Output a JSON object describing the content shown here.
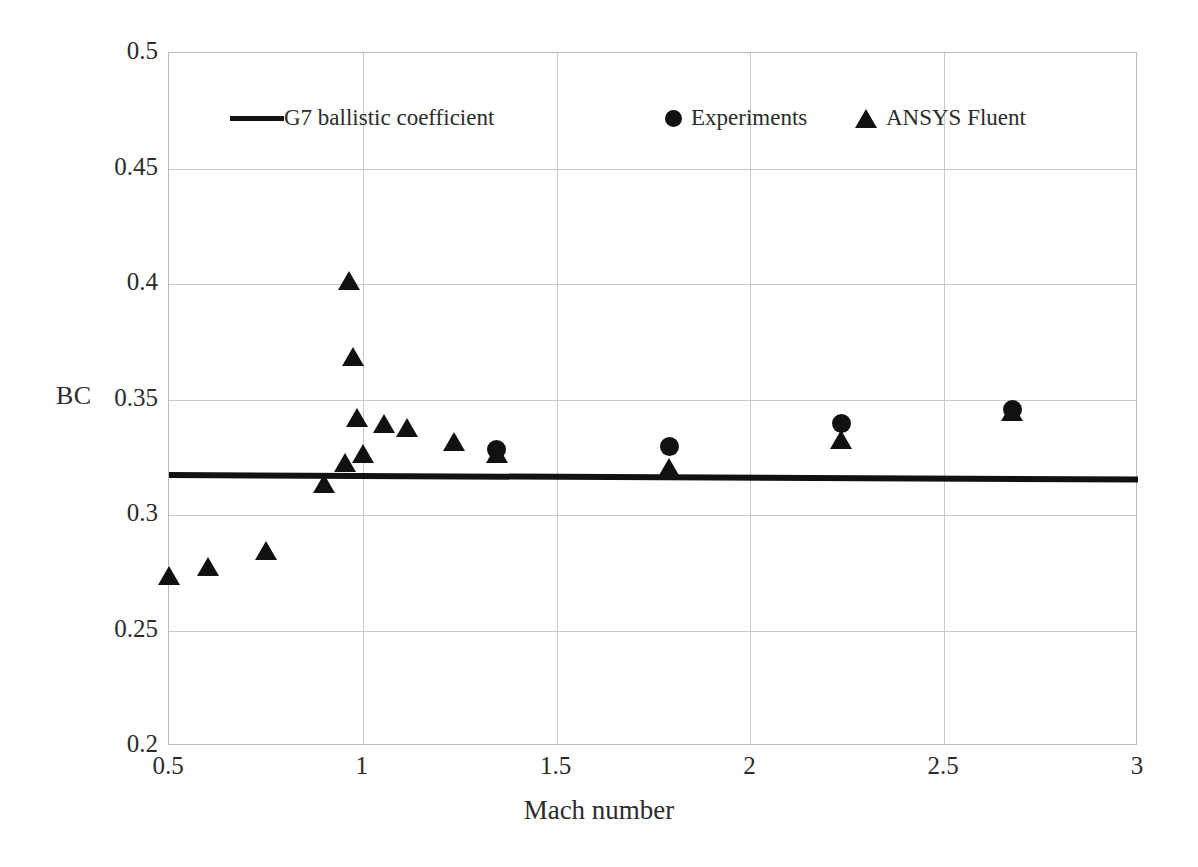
{
  "figure": {
    "background": "#ffffff",
    "marker_color": "#111111",
    "grid_color": "#c9c9c9"
  },
  "axes": {
    "y_title": "BC",
    "x_title": "Mach number",
    "y_ticks": [
      "0.2",
      "0.25",
      "0.3",
      "0.35",
      "0.4",
      "0.45",
      "0.5"
    ],
    "x_ticks": [
      "0.5",
      "1",
      "1.5",
      "2",
      "2.5",
      "3"
    ]
  },
  "legend": {
    "entries": [
      {
        "label": "G7 ballistic coefficient",
        "marker": "line-icon"
      },
      {
        "label": "Experiments",
        "marker": "circle-icon"
      },
      {
        "label": "ANSYS Fluent",
        "marker": "triangle-icon"
      }
    ]
  },
  "chart_data": {
    "type": "scatter",
    "title": "",
    "xlabel": "Mach number",
    "ylabel": "BC",
    "xlim": [
      0.5,
      3.0
    ],
    "ylim": [
      0.2,
      0.5
    ],
    "xticks": [
      0.5,
      1.0,
      1.5,
      2.0,
      2.5,
      3.0
    ],
    "yticks": [
      0.2,
      0.25,
      0.3,
      0.35,
      0.4,
      0.45,
      0.5
    ],
    "grid": true,
    "legend_position": "top-center",
    "series": [
      {
        "name": "G7 ballistic coefficient",
        "type": "line",
        "color": "#111111",
        "x": [
          0.5,
          3.0
        ],
        "y": [
          0.3175,
          0.3155
        ]
      },
      {
        "name": "Experiments",
        "type": "scatter",
        "marker": "circle",
        "color": "#111111",
        "points": [
          {
            "x": 1.345,
            "y": 0.3285
          },
          {
            "x": 1.79,
            "y": 0.3295
          },
          {
            "x": 2.235,
            "y": 0.3395
          },
          {
            "x": 2.675,
            "y": 0.3455
          }
        ]
      },
      {
        "name": "ANSYS Fluent",
        "type": "scatter",
        "marker": "triangle",
        "color": "#111111",
        "points": [
          {
            "x": 0.5,
            "y": 0.2735
          },
          {
            "x": 0.6,
            "y": 0.2775
          },
          {
            "x": 0.75,
            "y": 0.2845
          },
          {
            "x": 0.9,
            "y": 0.3135
          },
          {
            "x": 0.955,
            "y": 0.3225
          },
          {
            "x": 0.965,
            "y": 0.4015
          },
          {
            "x": 0.975,
            "y": 0.3685
          },
          {
            "x": 0.985,
            "y": 0.342
          },
          {
            "x": 1.0,
            "y": 0.3265
          },
          {
            "x": 1.055,
            "y": 0.3395
          },
          {
            "x": 1.115,
            "y": 0.3375
          },
          {
            "x": 1.235,
            "y": 0.3315
          },
          {
            "x": 1.345,
            "y": 0.3265
          },
          {
            "x": 1.79,
            "y": 0.3205
          },
          {
            "x": 2.235,
            "y": 0.3325
          },
          {
            "x": 2.675,
            "y": 0.3445
          }
        ]
      }
    ]
  }
}
